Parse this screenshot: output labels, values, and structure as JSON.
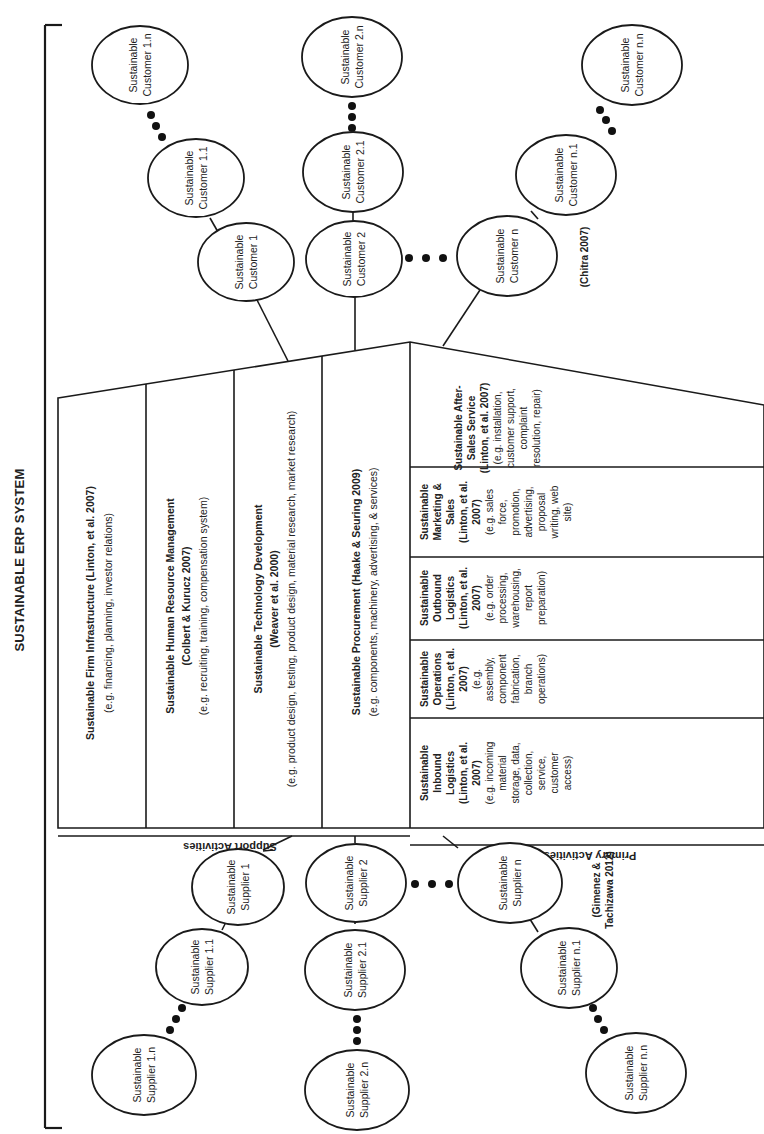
{
  "title": "SUSTAINABLE ERP SYSTEM",
  "support_label": "Support Activities",
  "primary_label": "Primary Activities",
  "support_activities": [
    {
      "name": "Sustainable Firm Infrastructure (Linton, et al. 2007)",
      "example": "(e.g. financing, planning, investor relations)"
    },
    {
      "name": "Sustainable Human Resource Management",
      "citation": "(Colbert & Kurucz 2007)",
      "example": "(e.g. recruiting, training, compensation system)"
    },
    {
      "name": "Sustainable Technology Development",
      "citation": "(Weaver et al. 2000)",
      "example": "(e.g. product design, testing, product design, material research, market research)"
    },
    {
      "name": "Sustainable Procurement (Haake & Seuring 2009)",
      "example": "(e.g. components, machinery, advertising, & services)"
    }
  ],
  "primary_activities": [
    {
      "lines": [
        "Sustainable",
        "Inbound",
        "Logistics",
        "(Linton, et al.",
        "2007)"
      ],
      "example_lines": [
        "(e.g. incoming",
        "material",
        "storage, data,",
        "collection,",
        "service,",
        "customer",
        "access)"
      ]
    },
    {
      "lines": [
        "Sustainable",
        "Operations",
        "(Linton, et al.",
        "2007)"
      ],
      "example_lines": [
        "(e.g.",
        "assembly,",
        "component",
        "fabrication,",
        "branch",
        "operations)"
      ]
    },
    {
      "lines": [
        "Sustainable",
        "Outbound",
        "Logistics",
        "(Linton, et al.",
        "2007)"
      ],
      "example_lines": [
        "(e.g. order",
        "processing,",
        "warehousing,",
        "report",
        "preparation)"
      ]
    },
    {
      "lines": [
        "Sustainable",
        "Marketing &",
        "Sales",
        "(Linton, et al.",
        "2007)"
      ],
      "example_lines": [
        "(e.g. sales",
        "force,",
        "promotion,",
        "advertising,",
        "proposal",
        "writing, web",
        "site)"
      ]
    },
    {
      "lines": [
        "Sustainable After-",
        "Sales Service",
        "(Linton, et al. 2007)"
      ],
      "example_lines": [
        "(e.g. installation,",
        "customer support,",
        "complaint",
        "resolution, repair)"
      ]
    }
  ],
  "customers": {
    "citation": "(Chitra 2007)",
    "nodes": [
      {
        "id": "c1",
        "line1": "Sustainable",
        "line2": "Customer 1"
      },
      {
        "id": "c11",
        "line1": "Sustainable",
        "line2": "Customer 1.1"
      },
      {
        "id": "c1n",
        "line1": "Sustainable",
        "line2": "Customer 1.n"
      },
      {
        "id": "c2",
        "line1": "Sustainable",
        "line2": "Customer 2"
      },
      {
        "id": "c21",
        "line1": "Sustainable",
        "line2": "Customer 2.1"
      },
      {
        "id": "c2n",
        "line1": "Sustainable",
        "line2": "Customer 2.n"
      },
      {
        "id": "cn",
        "line1": "Sustainable",
        "line2": "Customer n"
      },
      {
        "id": "cn1",
        "line1": "Sustainable",
        "line2": "Customer n.1"
      },
      {
        "id": "cnn",
        "line1": "Sustainable",
        "line2": "Customer n.n"
      }
    ]
  },
  "suppliers": {
    "citation_line1": "(Gimenez &",
    "citation_line2": "Tachizawa 2012)",
    "nodes": [
      {
        "id": "s1",
        "line1": "Sustainable",
        "line2": "Supplier 1"
      },
      {
        "id": "s11",
        "line1": "Sustainable",
        "line2": "Supplier 1.1"
      },
      {
        "id": "s1n",
        "line1": "Sustainable",
        "line2": "Supplier 1.n"
      },
      {
        "id": "s2",
        "line1": "Sustainable",
        "line2": "Supplier 2"
      },
      {
        "id": "s21",
        "line1": "Sustainable",
        "line2": "Supplier 2.1"
      },
      {
        "id": "s2n",
        "line1": "Sustainable",
        "line2": "Supplier 2.n"
      },
      {
        "id": "sn",
        "line1": "Sustainable",
        "line2": "Supplier n"
      },
      {
        "id": "sn1",
        "line1": "Sustainable",
        "line2": "Supplier n.1"
      },
      {
        "id": "snn",
        "line1": "Sustainable",
        "line2": "Supplier n.n"
      }
    ]
  }
}
